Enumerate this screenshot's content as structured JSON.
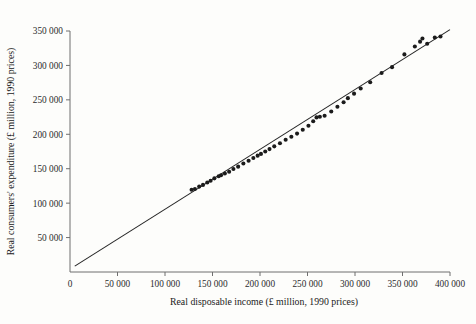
{
  "chart_data": {
    "type": "scatter",
    "title": "",
    "xlabel": "Real disposable income (£ million, 1990 prices)",
    "ylabel": "Real consumers' expenditure (£ million, 1990 prices)",
    "xlim": [
      0,
      400000
    ],
    "ylim": [
      0,
      350000
    ],
    "xticks": [
      0,
      50000,
      100000,
      150000,
      200000,
      250000,
      300000,
      350000,
      400000
    ],
    "yticks": [
      50000,
      100000,
      150000,
      200000,
      250000,
      300000,
      350000
    ],
    "xtick_labels": [
      "0",
      "50 000",
      "100 000",
      "150 000",
      "200 000",
      "250 000",
      "300 000",
      "350 000",
      "400 000"
    ],
    "ytick_labels": [
      "50 000",
      "100 000",
      "150 000",
      "200 000",
      "250 000",
      "300 000",
      "350 000"
    ],
    "grid": false,
    "legend": "none",
    "point_color": "#1b1b1b",
    "line_color": "#232323",
    "background_color": "#fdfdfb",
    "axis_color": "#6f6f6f",
    "series": [
      {
        "name": "Consumption vs income observations",
        "marker": "filled-circle",
        "points": [
          [
            128000,
            119500
          ],
          [
            131500,
            120500
          ],
          [
            136000,
            124000
          ],
          [
            140000,
            126500
          ],
          [
            144500,
            130000
          ],
          [
            148000,
            132500
          ],
          [
            152000,
            136000
          ],
          [
            156500,
            139000
          ],
          [
            159000,
            140500
          ],
          [
            163000,
            143000
          ],
          [
            167500,
            145500
          ],
          [
            172000,
            149500
          ],
          [
            177000,
            153000
          ],
          [
            182500,
            157500
          ],
          [
            188000,
            161500
          ],
          [
            193000,
            165500
          ],
          [
            197500,
            169000
          ],
          [
            201000,
            171500
          ],
          [
            205500,
            175000
          ],
          [
            210000,
            178500
          ],
          [
            215000,
            182500
          ],
          [
            221000,
            187000
          ],
          [
            227000,
            192000
          ],
          [
            233000,
            196500
          ],
          [
            239000,
            201000
          ],
          [
            245000,
            206500
          ],
          [
            251000,
            212500
          ],
          [
            256000,
            219000
          ],
          [
            259500,
            224500
          ],
          [
            263000,
            225500
          ],
          [
            268000,
            227000
          ],
          [
            275000,
            233000
          ],
          [
            281500,
            240000
          ],
          [
            288000,
            246500
          ],
          [
            292500,
            252500
          ],
          [
            299000,
            259000
          ],
          [
            306000,
            266500
          ],
          [
            316000,
            275500
          ],
          [
            328000,
            289000
          ],
          [
            339000,
            297500
          ],
          [
            352000,
            316000
          ],
          [
            363000,
            327500
          ],
          [
            368500,
            334500
          ],
          [
            371000,
            339000
          ],
          [
            376000,
            331500
          ],
          [
            384000,
            340500
          ],
          [
            390000,
            342000
          ]
        ]
      }
    ],
    "fit_line": {
      "name": "fitted regression line",
      "x_start": 5000,
      "y_start": 8500,
      "x_end": 400000,
      "y_end": 352000
    }
  },
  "figure": {
    "plot_area": {
      "x_left_px": 70,
      "x_right_px": 450,
      "y_top_px": 31,
      "y_bottom_px": 272
    }
  }
}
